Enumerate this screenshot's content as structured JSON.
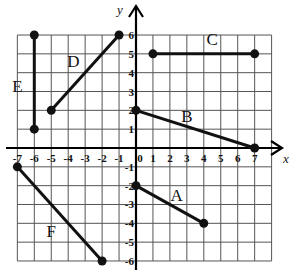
{
  "diagram": {
    "type": "coordinate-grid",
    "axes": {
      "x_label": "x",
      "y_label": "y",
      "x_range": [
        -7,
        8
      ],
      "y_range": [
        -6,
        6
      ],
      "x_ticks": [
        "-7",
        "-6",
        "-5",
        "-4",
        "-3",
        "-2",
        "-1",
        "0",
        "1",
        "2",
        "3",
        "4",
        "5",
        "6",
        "7"
      ],
      "y_ticks": [
        "6",
        "5",
        "4",
        "3",
        "2",
        "1",
        "-1",
        "-2",
        "-3",
        "-4",
        "-5",
        "-6"
      ]
    },
    "colors": {
      "grid": "#555555",
      "axis": "#000000",
      "segment": "#111111",
      "background": "#ffffff"
    },
    "segments": [
      {
        "label": "A",
        "start": [
          0,
          -2
        ],
        "end": [
          4,
          -4
        ]
      },
      {
        "label": "B",
        "start": [
          0,
          2
        ],
        "end": [
          7,
          0
        ]
      },
      {
        "label": "C",
        "start": [
          1,
          5
        ],
        "end": [
          7,
          5
        ]
      },
      {
        "label": "D",
        "start": [
          -5,
          2
        ],
        "end": [
          -1,
          6
        ]
      },
      {
        "label": "E",
        "start": [
          -6,
          1
        ],
        "end": [
          -6,
          6
        ]
      },
      {
        "label": "F",
        "start": [
          -7,
          -1
        ],
        "end": [
          -2,
          -6
        ]
      }
    ]
  }
}
